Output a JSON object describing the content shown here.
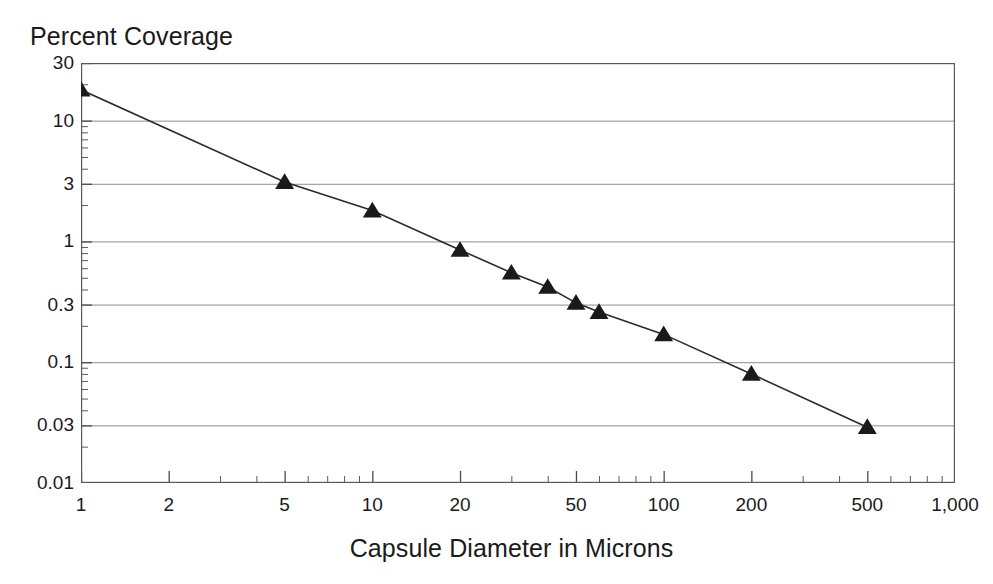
{
  "chart_data": {
    "type": "line",
    "title": "",
    "ylabel": "Percent Coverage",
    "xlabel": "Capsule Diameter in Microns",
    "xscale": "log",
    "yscale": "log",
    "xlim": [
      1,
      1000
    ],
    "ylim": [
      0.01,
      30
    ],
    "grid": true,
    "legend": "none",
    "marker": "triangle-up",
    "marker_color": "#1a1a1a",
    "line_color": "#2b2b2b",
    "x_ticks": [
      {
        "value": 1,
        "label": "1"
      },
      {
        "value": 2,
        "label": "2"
      },
      {
        "value": 5,
        "label": "5"
      },
      {
        "value": 10,
        "label": "10"
      },
      {
        "value": 20,
        "label": "20"
      },
      {
        "value": 50,
        "label": "50"
      },
      {
        "value": 100,
        "label": "100"
      },
      {
        "value": 200,
        "label": "200"
      },
      {
        "value": 500,
        "label": "500"
      },
      {
        "value": 1000,
        "label": "1,000"
      }
    ],
    "y_ticks": [
      {
        "value": 30,
        "label": "30"
      },
      {
        "value": 10,
        "label": "10"
      },
      {
        "value": 3,
        "label": "3"
      },
      {
        "value": 1,
        "label": "1"
      },
      {
        "value": 0.3,
        "label": "0.3"
      },
      {
        "value": 0.1,
        "label": "0.1"
      },
      {
        "value": 0.03,
        "label": "0.03"
      },
      {
        "value": 0.01,
        "label": "0.01"
      }
    ],
    "gridline_values": [
      10,
      3,
      1,
      0.3,
      0.1,
      0.03
    ],
    "series": [
      {
        "name": "Percent Coverage vs Capsule Diameter",
        "x": [
          1,
          5,
          10,
          20,
          30,
          40,
          50,
          60,
          100,
          200,
          500
        ],
        "y": [
          18,
          3.1,
          1.8,
          0.85,
          0.55,
          0.42,
          0.31,
          0.26,
          0.17,
          0.08,
          0.029
        ]
      }
    ]
  },
  "labels": {
    "y_axis_title": "Percent Coverage",
    "x_axis_title": "Capsule Diameter in Microns"
  }
}
